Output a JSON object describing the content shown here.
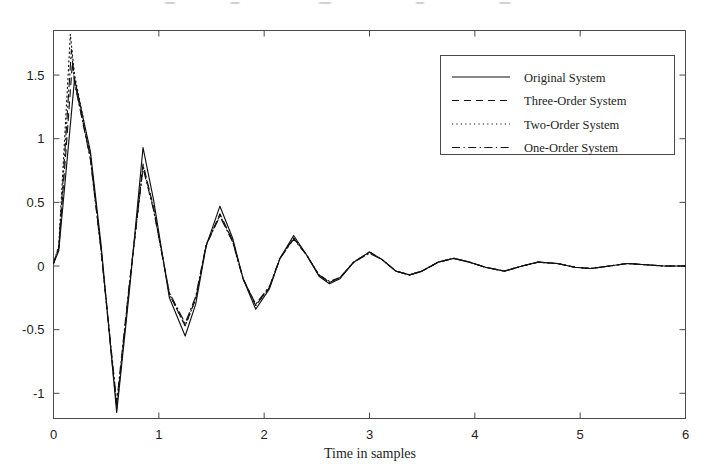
{
  "figure": {
    "background_color": "#ffffff",
    "line_color": "#111111",
    "axis_color": "#4a4a4a"
  },
  "axes": {
    "xlabel": "Time in samples",
    "ylabel": "",
    "x_ticks": [
      "0",
      "1",
      "2",
      "3",
      "4",
      "5",
      "6"
    ],
    "y_ticks": [
      "1.5",
      "1",
      "0.5",
      "0",
      "-0.5",
      "-1"
    ]
  },
  "legend": {
    "position": "upper-right",
    "entries": [
      {
        "label": "Original System",
        "style": "solid"
      },
      {
        "label": "Three-Order System",
        "style": "dashed"
      },
      {
        "label": "Two-Order System",
        "style": "dotted"
      },
      {
        "label": "One-Order System",
        "style": "dashdot"
      }
    ]
  },
  "chart_data": {
    "type": "line",
    "title": "",
    "xlabel": "Time in samples",
    "ylabel": "",
    "xlim": [
      0,
      6
    ],
    "ylim": [
      -1.25,
      1.9
    ],
    "grid": false,
    "legend_position": "upper right",
    "x_ticks": [
      0,
      1,
      2,
      3,
      4,
      5,
      6
    ],
    "y_ticks": [
      -1,
      -0.5,
      0,
      0.5,
      1,
      1.5
    ],
    "series": [
      {
        "name": "Original System",
        "style": "solid",
        "x": [
          0.0,
          0.05,
          0.2,
          0.35,
          0.45,
          0.6,
          0.72,
          0.85,
          0.95,
          1.1,
          1.25,
          1.35,
          1.45,
          1.58,
          1.7,
          1.8,
          1.92,
          2.05,
          2.15,
          2.28,
          2.4,
          2.52,
          2.62,
          2.72,
          2.85,
          3.0,
          3.12,
          3.25,
          3.38,
          3.5,
          3.65,
          3.8,
          3.95,
          4.1,
          4.28,
          4.45,
          4.6,
          4.78,
          4.95,
          5.1,
          5.28,
          5.45,
          5.62,
          5.8,
          6.0
        ],
        "y": [
          0.02,
          0.12,
          1.47,
          0.9,
          0.18,
          -1.15,
          -0.2,
          0.93,
          0.52,
          -0.25,
          -0.55,
          -0.3,
          0.16,
          0.47,
          0.22,
          -0.1,
          -0.34,
          -0.18,
          0.06,
          0.24,
          0.09,
          -0.08,
          -0.14,
          -0.1,
          0.03,
          0.11,
          0.05,
          -0.04,
          -0.07,
          -0.04,
          0.03,
          0.06,
          0.03,
          -0.01,
          -0.04,
          0.0,
          0.03,
          0.02,
          -0.01,
          -0.02,
          0.0,
          0.02,
          0.01,
          0.0,
          0.0
        ]
      },
      {
        "name": "Three-Order System",
        "style": "dashed",
        "x": [
          0.0,
          0.05,
          0.18,
          0.2,
          0.35,
          0.45,
          0.6,
          0.72,
          0.85,
          0.95,
          1.1,
          1.25,
          1.35,
          1.45,
          1.58,
          1.7,
          1.8,
          1.92,
          2.05,
          2.15,
          2.28,
          2.4,
          2.52,
          2.62,
          2.72,
          2.85,
          3.0,
          3.12,
          3.25,
          3.38,
          3.5,
          3.65,
          3.8,
          3.95,
          4.1,
          4.28,
          4.45,
          4.6,
          4.78,
          4.95,
          5.1,
          5.28,
          5.45,
          5.62,
          5.8,
          6.0
        ],
        "y": [
          0.02,
          0.14,
          1.6,
          1.45,
          0.85,
          0.14,
          -1.12,
          -0.16,
          0.8,
          0.46,
          -0.22,
          -0.47,
          -0.26,
          0.16,
          0.41,
          0.2,
          -0.1,
          -0.31,
          -0.17,
          0.06,
          0.22,
          0.09,
          -0.07,
          -0.13,
          -0.09,
          0.03,
          0.11,
          0.05,
          -0.04,
          -0.07,
          -0.04,
          0.03,
          0.06,
          0.03,
          -0.01,
          -0.04,
          0.0,
          0.03,
          0.02,
          -0.01,
          -0.02,
          0.0,
          0.02,
          0.01,
          0.0,
          0.0
        ]
      },
      {
        "name": "Two-Order System",
        "style": "dotted",
        "x": [
          0.0,
          0.05,
          0.16,
          0.2,
          0.35,
          0.45,
          0.6,
          0.72,
          0.85,
          0.95,
          1.1,
          1.25,
          1.35,
          1.45,
          1.58,
          1.7,
          1.8,
          1.92,
          2.05,
          2.15,
          2.28,
          2.4,
          2.52,
          2.62,
          2.72,
          2.85,
          3.0,
          3.12,
          3.25,
          3.38,
          3.5,
          3.65,
          3.8,
          3.95,
          4.1,
          4.28,
          4.45,
          4.6,
          4.78,
          4.95,
          5.1,
          5.28,
          5.45,
          5.62,
          5.8,
          6.0
        ],
        "y": [
          0.02,
          0.16,
          1.82,
          1.5,
          0.88,
          0.15,
          -1.1,
          -0.16,
          0.79,
          0.45,
          -0.22,
          -0.47,
          -0.26,
          0.17,
          0.4,
          0.2,
          -0.1,
          -0.31,
          -0.17,
          0.06,
          0.22,
          0.09,
          -0.07,
          -0.13,
          -0.09,
          0.03,
          0.11,
          0.05,
          -0.04,
          -0.07,
          -0.04,
          0.03,
          0.06,
          0.03,
          -0.01,
          -0.04,
          0.0,
          0.03,
          0.02,
          -0.01,
          -0.02,
          0.0,
          0.02,
          0.01,
          0.0,
          0.0
        ]
      },
      {
        "name": "One-Order System",
        "style": "dashdot",
        "x": [
          0.0,
          0.05,
          0.17,
          0.2,
          0.35,
          0.45,
          0.6,
          0.72,
          0.85,
          0.95,
          1.1,
          1.25,
          1.35,
          1.45,
          1.58,
          1.7,
          1.8,
          1.92,
          2.05,
          2.15,
          2.28,
          2.4,
          2.52,
          2.62,
          2.72,
          2.85,
          3.0,
          3.12,
          3.25,
          3.38,
          3.5,
          3.65,
          3.8,
          3.95,
          4.1,
          4.28,
          4.45,
          4.6,
          4.78,
          4.95,
          5.1,
          5.28,
          5.45,
          5.62,
          5.8,
          6.0
        ],
        "y": [
          0.02,
          0.15,
          1.7,
          1.44,
          0.84,
          0.13,
          -1.07,
          -0.14,
          0.77,
          0.44,
          -0.21,
          -0.45,
          -0.24,
          0.17,
          0.39,
          0.19,
          -0.1,
          -0.3,
          -0.16,
          0.06,
          0.21,
          0.09,
          -0.07,
          -0.12,
          -0.09,
          0.03,
          0.1,
          0.05,
          -0.04,
          -0.07,
          -0.04,
          0.03,
          0.06,
          0.03,
          -0.01,
          -0.04,
          0.0,
          0.03,
          0.02,
          -0.01,
          -0.02,
          0.0,
          0.02,
          0.01,
          0.0,
          0.0
        ]
      }
    ]
  }
}
